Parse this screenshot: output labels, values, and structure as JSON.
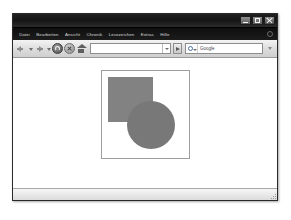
{
  "window": {
    "title": "",
    "controls": [
      {
        "name": "minimize",
        "label": ""
      },
      {
        "name": "maximize",
        "label": ""
      },
      {
        "name": "close",
        "label": ""
      }
    ]
  },
  "menu": {
    "items": [
      {
        "label": "Datei"
      },
      {
        "label": "Bearbeiten"
      },
      {
        "label": "Ansicht"
      },
      {
        "label": "Chronik"
      },
      {
        "label": "Lesezeichen"
      },
      {
        "label": "Extras"
      },
      {
        "label": "Hilfe"
      }
    ]
  },
  "toolbar": {
    "back_icon": "arrow-left-icon",
    "back_dropdown_icon": "chevron-down-icon",
    "forward_icon": "arrow-right-icon",
    "forward_dropdown_icon": "chevron-down-icon",
    "reload_icon": "reload-icon",
    "stop_icon": "stop-icon",
    "home_icon": "home-icon",
    "url": {
      "value": "",
      "placeholder": "",
      "dropdown_icon": "chevron-down-icon"
    },
    "go": {
      "label": "",
      "icon": "go-arrow-icon"
    },
    "search": {
      "engine": "Google",
      "engine_icon": "google-search-icon",
      "value": "Google",
      "placeholder": "Google"
    },
    "overflow_icon": "chevron-down-icon"
  },
  "page": {
    "canvas": {
      "name": "shape-canvas",
      "border_color": "#9e9e9e",
      "background": "#ffffff"
    },
    "shapes": [
      {
        "name": "square",
        "type": "rectangle",
        "color": "#828282",
        "x": 6,
        "y": 6,
        "width": 45,
        "height": 45
      },
      {
        "name": "circle",
        "type": "circle",
        "color": "#787878",
        "x": 25,
        "y": 30,
        "width": 48,
        "height": 48
      }
    ]
  },
  "status": {
    "text": "",
    "resize_grip_icon": "resize-grip-icon"
  },
  "colors": {
    "title_bar": "#141414",
    "menu_bar": "#141414",
    "toolbar": "#dcdcdc",
    "page_background": "#ffffff",
    "square_fill": "#828282",
    "circle_fill": "#787878"
  }
}
